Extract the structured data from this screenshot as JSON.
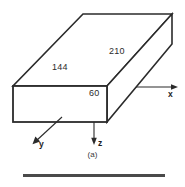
{
  "figure": {
    "caption": "(a)",
    "type": "3d-rectangular-box-with-axes",
    "line_color": "#2b2b2b",
    "background_color": "#ffffff",
    "dimensions": [
      {
        "id": "depth",
        "value": "210",
        "edge": "top-right-diagonal"
      },
      {
        "id": "length",
        "value": "144",
        "edge": "front-top-horizontal"
      },
      {
        "id": "height",
        "value": "60",
        "edge": "front-right-vertical"
      }
    ],
    "axes": [
      {
        "id": "x",
        "label": "x",
        "direction": "right"
      },
      {
        "id": "y",
        "label": "y",
        "direction": "down-left"
      },
      {
        "id": "z",
        "label": "z",
        "direction": "down"
      }
    ]
  }
}
